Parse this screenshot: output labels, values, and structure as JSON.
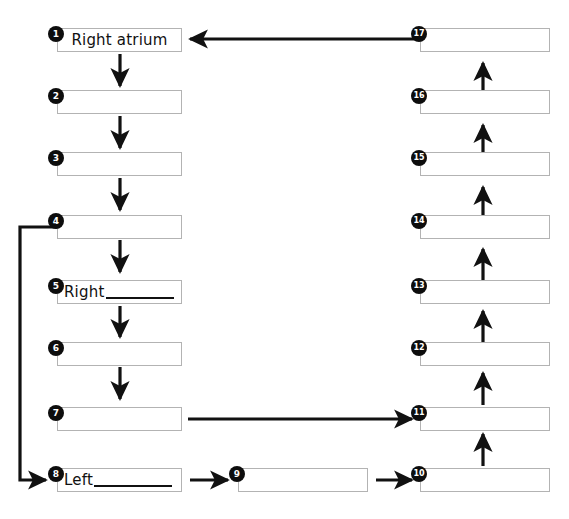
{
  "diagram": {
    "canvas": {
      "width": 569,
      "height": 519
    },
    "colors": {
      "background": "#ffffff",
      "box_border": "#b3b3b3",
      "marker_fill": "#0d0d0d",
      "marker_text": "#ffffff",
      "arrow": "#111111",
      "text": "#111111"
    },
    "left_column": [
      {
        "number": "1",
        "label": "Right atrium",
        "blank": false,
        "prefix": ""
      },
      {
        "number": "2",
        "label": "",
        "blank": false,
        "prefix": ""
      },
      {
        "number": "3",
        "label": "",
        "blank": false,
        "prefix": ""
      },
      {
        "number": "4",
        "label": "",
        "blank": false,
        "prefix": ""
      },
      {
        "number": "5",
        "label": "Right",
        "blank": true,
        "prefix": "Right"
      },
      {
        "number": "6",
        "label": "",
        "blank": false,
        "prefix": ""
      },
      {
        "number": "7",
        "label": "",
        "blank": false,
        "prefix": ""
      },
      {
        "number": "8",
        "label": "Left",
        "blank": true,
        "prefix": "Left"
      }
    ],
    "bottom_middle": [
      {
        "number": "9",
        "label": "",
        "blank": false,
        "prefix": ""
      }
    ],
    "right_column": [
      {
        "number": "17",
        "label": "",
        "blank": false,
        "prefix": ""
      },
      {
        "number": "16",
        "label": "",
        "blank": false,
        "prefix": ""
      },
      {
        "number": "15",
        "label": "",
        "blank": false,
        "prefix": ""
      },
      {
        "number": "14",
        "label": "",
        "blank": false,
        "prefix": ""
      },
      {
        "number": "13",
        "label": "",
        "blank": false,
        "prefix": ""
      },
      {
        "number": "12",
        "label": "",
        "blank": false,
        "prefix": ""
      },
      {
        "number": "11",
        "label": "",
        "blank": false,
        "prefix": ""
      },
      {
        "number": "10",
        "label": "",
        "blank": false,
        "prefix": ""
      }
    ]
  }
}
